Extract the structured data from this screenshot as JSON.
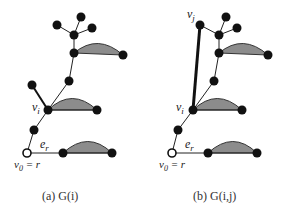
{
  "figure": {
    "panels": [
      {
        "id": "a",
        "caption": "(a)  G(i)",
        "labels": {
          "vi": "v",
          "vi_sub": "i",
          "er": "e",
          "er_sub": "r",
          "v0": "v",
          "v0_sub": "0",
          "v0_eq": " = r"
        }
      },
      {
        "id": "b",
        "caption": "(b)  G(i,j)",
        "labels": {
          "vj": "v",
          "vj_sub": "j",
          "vi": "v",
          "vi_sub": "i",
          "er": "e",
          "er_sub": "r",
          "v0": "v",
          "v0_sub": "0",
          "v0_eq": " = r"
        }
      }
    ],
    "colors": {
      "node": "#111111",
      "root_fill": "#ffffff",
      "shaded_region": "#8c8c8c",
      "edge": "#222222"
    }
  }
}
